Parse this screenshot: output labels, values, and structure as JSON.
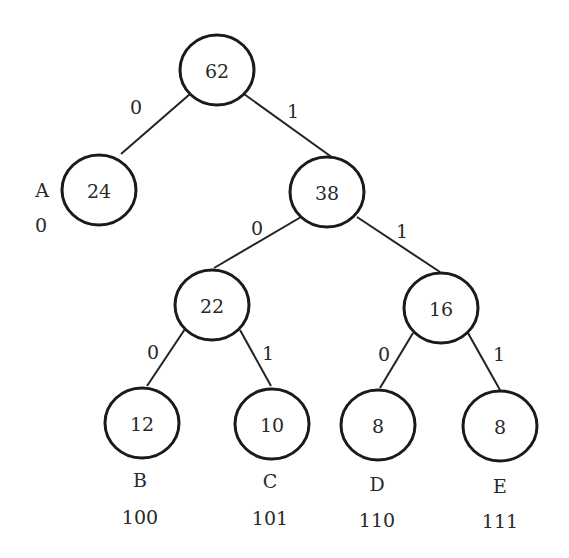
{
  "diagram": {
    "type": "huffman-tree",
    "nodes": [
      {
        "id": "root",
        "weight": "62",
        "cx": 217,
        "cy": 70
      },
      {
        "id": "A",
        "weight": "24",
        "cx": 99,
        "cy": 190,
        "symbol": "A",
        "code": "0"
      },
      {
        "id": "n38",
        "weight": "38",
        "cx": 327,
        "cy": 192
      },
      {
        "id": "n22",
        "weight": "22",
        "cx": 212,
        "cy": 305
      },
      {
        "id": "n16",
        "weight": "16",
        "cx": 441,
        "cy": 308
      },
      {
        "id": "B",
        "weight": "12",
        "cx": 142,
        "cy": 423,
        "symbol": "B",
        "code": "100"
      },
      {
        "id": "C",
        "weight": "10",
        "cx": 272,
        "cy": 424,
        "symbol": "C",
        "code": "101"
      },
      {
        "id": "D",
        "weight": "8",
        "cx": 378,
        "cy": 425,
        "symbol": "D",
        "code": "110"
      },
      {
        "id": "E",
        "weight": "8",
        "cx": 500,
        "cy": 426,
        "symbol": "E",
        "code": "111"
      }
    ],
    "edges": [
      {
        "from": "root",
        "to": "A",
        "bit": "0"
      },
      {
        "from": "root",
        "to": "n38",
        "bit": "1"
      },
      {
        "from": "n38",
        "to": "n22",
        "bit": "0"
      },
      {
        "from": "n38",
        "to": "n16",
        "bit": "1"
      },
      {
        "from": "n22",
        "to": "B",
        "bit": "0"
      },
      {
        "from": "n22",
        "to": "C",
        "bit": "1"
      },
      {
        "from": "n16",
        "to": "D",
        "bit": "0"
      },
      {
        "from": "n16",
        "to": "E",
        "bit": "1"
      }
    ]
  },
  "labels": {
    "root_weight": "62",
    "a_weight": "24",
    "n38_weight": "38",
    "n22_weight": "22",
    "n16_weight": "16",
    "b_weight": "12",
    "c_weight": "10",
    "d_weight": "8",
    "e_weight": "8",
    "edge_root_a": "0",
    "edge_root_38": "1",
    "edge_38_22": "0",
    "edge_38_16": "1",
    "edge_22_b": "0",
    "edge_22_c": "1",
    "edge_16_d": "0",
    "edge_16_e": "1",
    "sym_a": "A",
    "code_a": "0",
    "sym_b": "B",
    "code_b": "100",
    "sym_c": "C",
    "code_c": "101",
    "sym_d": "D",
    "code_d": "110",
    "sym_e": "E",
    "code_e": "111"
  }
}
